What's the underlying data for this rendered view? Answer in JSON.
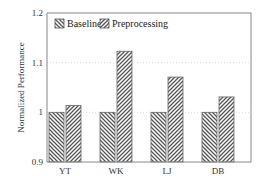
{
  "chart_data": {
    "type": "bar",
    "title": "",
    "xlabel": "",
    "ylabel": "Normalized Performance",
    "ylim": [
      0.9,
      1.2
    ],
    "yticks": [
      "0.9",
      "1",
      "1.1",
      "1.2"
    ],
    "categories": [
      "YT",
      "WK",
      "LJ",
      "DB"
    ],
    "series": [
      {
        "name": "Baseline",
        "values": [
          1.0,
          1.0,
          1.0,
          1.0
        ],
        "pattern": "back-diagonal-hatch"
      },
      {
        "name": "Preprocessing",
        "values": [
          1.014,
          1.123,
          1.071,
          1.031
        ],
        "pattern": "forward-diagonal-hatch"
      }
    ],
    "grid": "horizontal dotted",
    "legend_position": "top-left inside"
  },
  "colors": {
    "hatch": "#555555",
    "frame": "#888888",
    "grid": "#dddddd"
  }
}
